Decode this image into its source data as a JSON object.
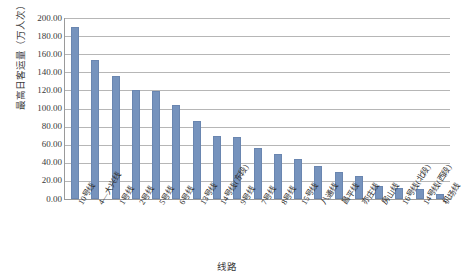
{
  "chart_data": {
    "type": "bar",
    "title": "",
    "xlabel": "线路",
    "ylabel": "最高日客运量（万人次）",
    "ylim": [
      0,
      200
    ],
    "ytick_step": 20,
    "grid": true,
    "legend": "none",
    "bar_color": "#7693BD",
    "axis_color": "#9A9A9A",
    "gridline_color": "#B6B6B6",
    "yticks": [
      "0.00",
      "20.00",
      "40.00",
      "60.00",
      "80.00",
      "100.00",
      "120.00",
      "140.00",
      "160.00",
      "180.00",
      "200.00"
    ],
    "categories": [
      "10号线",
      "4—大兴线",
      "1号线",
      "2号线",
      "5号线",
      "6号线",
      "13号线",
      "14号线(东段)",
      "9号线",
      "7号线",
      "8号线",
      "15号线",
      "八通线",
      "昌平线",
      "亦庄线",
      "房山线",
      "16号线(北段)",
      "14号线(西段)",
      "机场线"
    ],
    "values": [
      190,
      154,
      136,
      120,
      119,
      104,
      86,
      70,
      68,
      56,
      50,
      44,
      36,
      30,
      25,
      14,
      12,
      11,
      5
    ]
  }
}
